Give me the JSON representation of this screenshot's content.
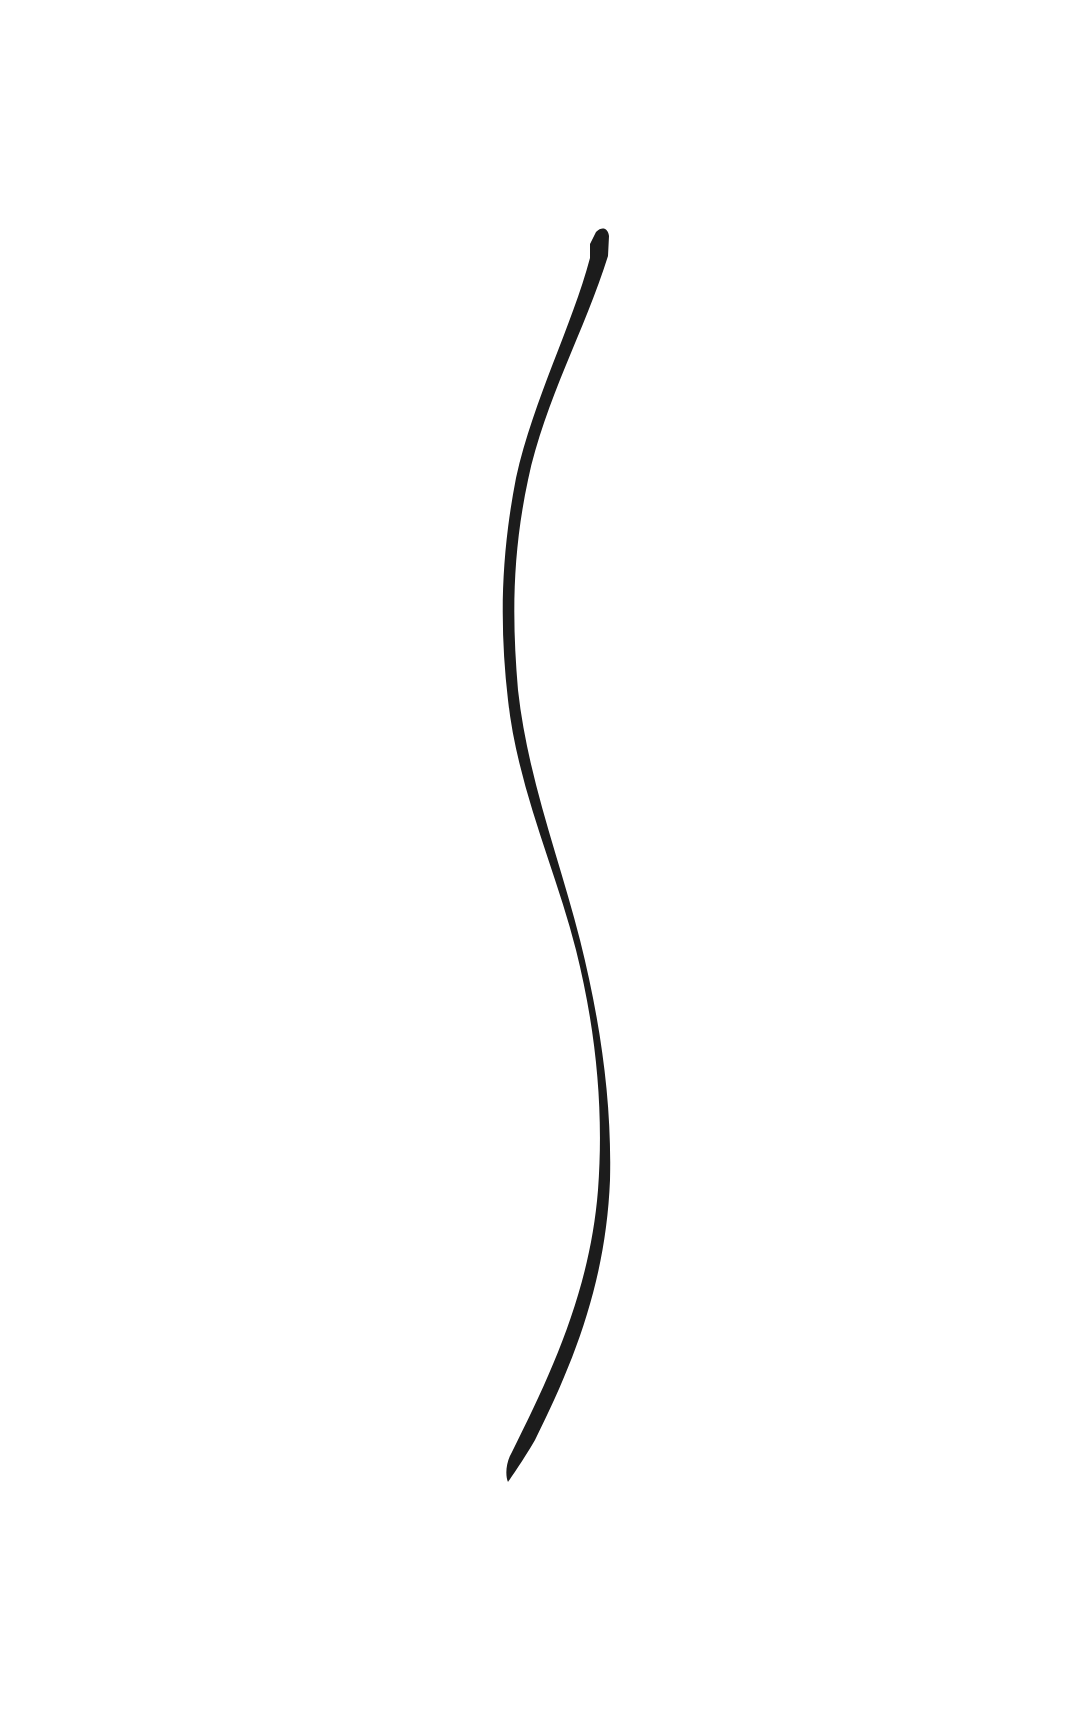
{
  "canvas": {
    "width": 1084,
    "height": 1729,
    "background": "#ffffff"
  },
  "stroke": {
    "color": "#1c1c1c",
    "description": "single black ink brush stroke, S-curve",
    "path": "M596,232 C602,226 608,228 609,236 L608,256 C585,330 545,400 528,480 C512,555 512,620 518,690 C528,780 560,860 580,940 C600,1020 612,1100 610,1180 C606,1280 575,1360 535,1440 C522,1462 512,1476 508,1482 C505,1475 506,1462 512,1452 C552,1372 590,1290 598,1190 C604,1110 596,1030 576,950 C556,870 518,790 508,700 C500,630 500,560 516,478 C534,398 572,326 590,258 L590,244 Z",
    "start_point": [
      605,
      232
    ],
    "end_point": [
      508,
      1482
    ]
  }
}
